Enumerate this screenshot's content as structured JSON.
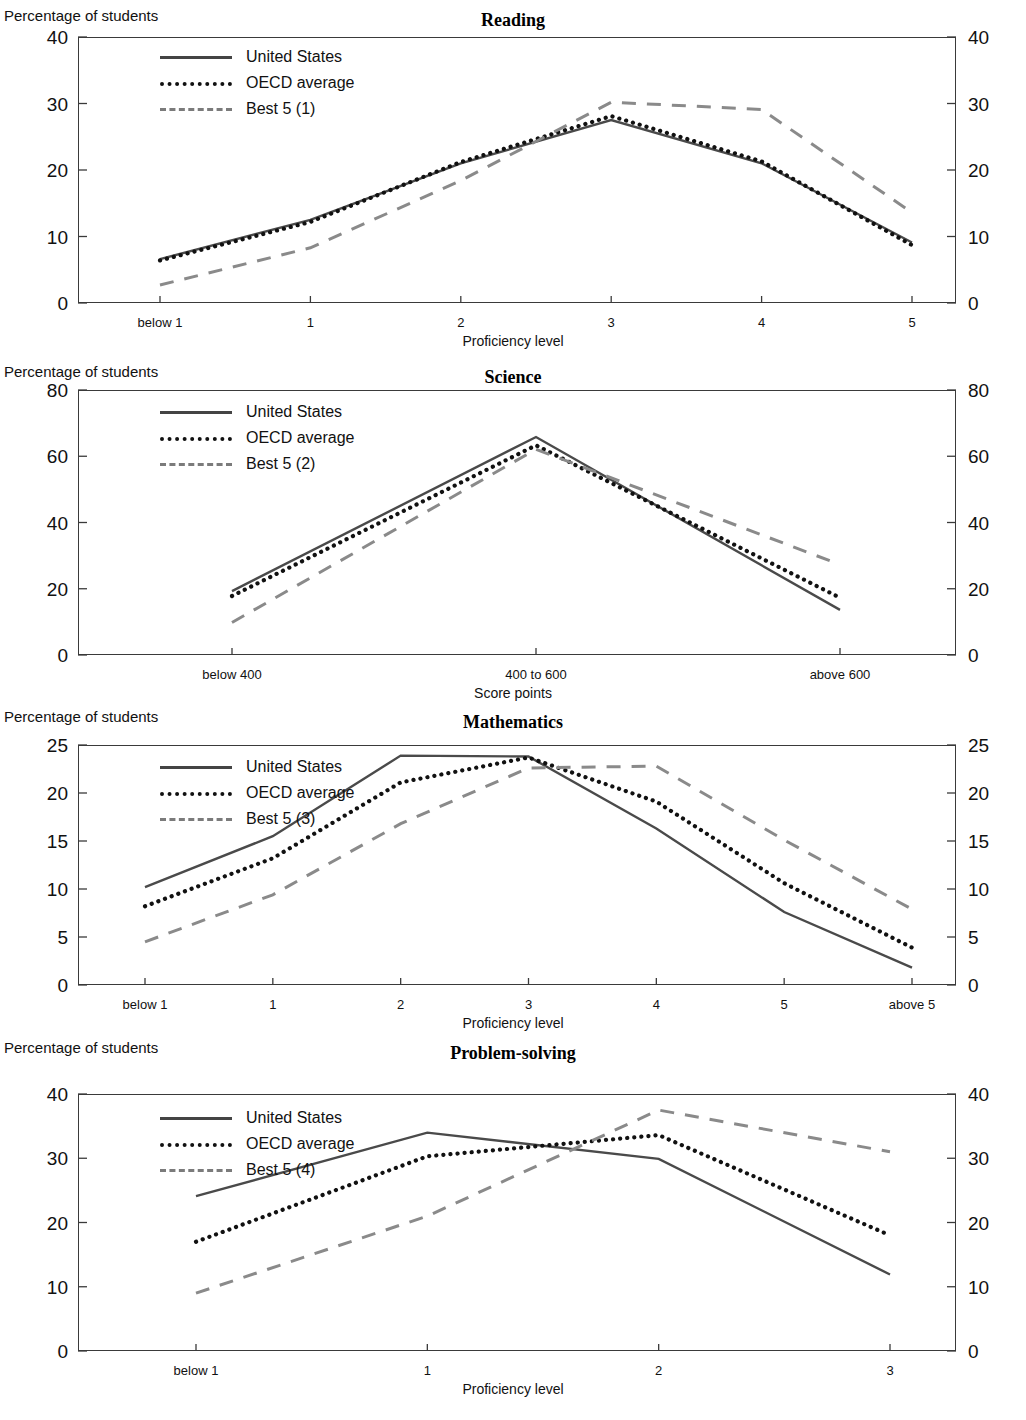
{
  "common": {
    "y_axis_label": "Percentage of students",
    "series_names": {
      "us": "United States",
      "oecd": "OECD average"
    }
  },
  "panels": [
    {
      "key": "reading",
      "title": "Reading",
      "y_label": "Percentage of students",
      "x_title": "Proficiency level",
      "best5_label": "Best 5 (1)",
      "us_label": "United States",
      "oecd_label": "OECD average",
      "yticks": [
        "0",
        "10",
        "20",
        "30",
        "40"
      ],
      "xticks": [
        "below 1",
        "1",
        "2",
        "3",
        "4",
        "5"
      ]
    },
    {
      "key": "science",
      "title": "Science",
      "y_label": "Percentage of students",
      "x_title": "Score points",
      "best5_label": "Best 5 (2)",
      "us_label": "United States",
      "oecd_label": "OECD average",
      "yticks": [
        "0",
        "20",
        "40",
        "60",
        "80"
      ],
      "xticks": [
        "below 400",
        "400 to 600",
        "above 600"
      ]
    },
    {
      "key": "mathematics",
      "title": "Mathematics",
      "y_label": "Percentage of students",
      "x_title": "Proficiency level",
      "best5_label": "Best 5 (3)",
      "us_label": "United States",
      "oecd_label": "OECD average",
      "yticks": [
        "0",
        "5",
        "10",
        "15",
        "20",
        "25"
      ],
      "xticks": [
        "below 1",
        "1",
        "2",
        "3",
        "4",
        "5",
        "above 5"
      ]
    },
    {
      "key": "problem-solving",
      "title": "Problem-solving",
      "y_label": "Percentage of students",
      "x_title": "Proficiency level",
      "best5_label": "Best 5 (4)",
      "us_label": "United States",
      "oecd_label": "OECD average",
      "yticks": [
        "0",
        "10",
        "20",
        "30",
        "40"
      ],
      "xticks": [
        "below 1",
        "1",
        "2",
        "3"
      ]
    }
  ],
  "chart_data": [
    {
      "type": "line",
      "title": "Reading",
      "xlabel": "Proficiency level",
      "ylabel": "Percentage of students",
      "categories": [
        "below 1",
        "1",
        "2",
        "3",
        "4",
        "5"
      ],
      "ylim": [
        0,
        40
      ],
      "yticks": [
        0,
        10,
        20,
        30,
        40
      ],
      "grid": false,
      "legend_position": "top-left",
      "series": [
        {
          "name": "United States",
          "style": "solid",
          "values": [
            6.6,
            12.5,
            21.0,
            27.5,
            21.0,
            9.1
          ]
        },
        {
          "name": "OECD average",
          "style": "dotted",
          "values": [
            6.4,
            12.2,
            21.2,
            28.1,
            21.3,
            8.7
          ]
        },
        {
          "name": "Best 5 (1)",
          "style": "dashed",
          "values": [
            2.7,
            8.3,
            18.4,
            30.2,
            29.1,
            13.6
          ]
        }
      ]
    },
    {
      "type": "line",
      "title": "Science",
      "xlabel": "Score points",
      "ylabel": "Percentage of students",
      "categories": [
        "below 400",
        "400 to 600",
        "above 600"
      ],
      "ylim": [
        0,
        80
      ],
      "yticks": [
        0,
        20,
        40,
        60,
        80
      ],
      "grid": false,
      "legend_position": "top-left",
      "series": [
        {
          "name": "United States",
          "style": "solid",
          "values": [
            19.3,
            65.8,
            13.6
          ]
        },
        {
          "name": "OECD average",
          "style": "dotted",
          "values": [
            17.8,
            63.3,
            17.3
          ]
        },
        {
          "name": "Best 5 (2)",
          "style": "dashed",
          "values": [
            9.8,
            62.1,
            27.3
          ]
        }
      ]
    },
    {
      "type": "line",
      "title": "Mathematics",
      "xlabel": "Proficiency level",
      "ylabel": "Percentage of students",
      "categories": [
        "below 1",
        "1",
        "2",
        "3",
        "4",
        "5",
        "above 5"
      ],
      "ylim": [
        0,
        25
      ],
      "yticks": [
        0,
        5,
        10,
        15,
        20,
        25
      ],
      "grid": false,
      "legend_position": "top-left",
      "series": [
        {
          "name": "United States",
          "style": "solid",
          "values": [
            10.2,
            15.5,
            23.9,
            23.8,
            16.3,
            7.6,
            1.8
          ]
        },
        {
          "name": "OECD average",
          "style": "dotted",
          "values": [
            8.2,
            13.2,
            21.1,
            23.7,
            19.1,
            10.6,
            3.9
          ]
        },
        {
          "name": "Best 5 (3)",
          "style": "dashed",
          "values": [
            4.5,
            9.4,
            16.8,
            22.6,
            22.8,
            15.1,
            7.9
          ]
        }
      ]
    },
    {
      "type": "line",
      "title": "Problem-solving",
      "xlabel": "Proficiency level",
      "ylabel": "Percentage of students",
      "categories": [
        "below 1",
        "1",
        "2",
        "3"
      ],
      "ylim": [
        0,
        40
      ],
      "yticks": [
        0,
        10,
        20,
        30,
        40
      ],
      "grid": false,
      "legend_position": "top-left",
      "series": [
        {
          "name": "United States",
          "style": "solid",
          "values": [
            24.1,
            34.0,
            29.9,
            11.9
          ]
        },
        {
          "name": "OECD average",
          "style": "dotted",
          "values": [
            17.0,
            30.3,
            33.6,
            18.0
          ]
        },
        {
          "name": "Best 5 (4)",
          "style": "dashed",
          "values": [
            9.0,
            21.0,
            37.5,
            31.0
          ]
        }
      ]
    }
  ]
}
